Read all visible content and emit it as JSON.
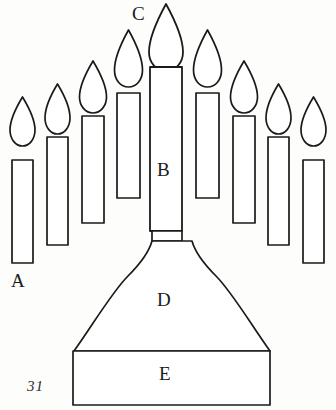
{
  "figure": {
    "number": "31",
    "style": "line-drawing",
    "stroke_color": "#1a1a1a",
    "fill_color": "#ffffff",
    "background_color": "#fdfdfb",
    "width": 336,
    "height": 410
  },
  "labels": {
    "a": "A",
    "b": "B",
    "c": "C",
    "d": "D",
    "e": "E"
  },
  "label_meanings": {
    "a": "outer candle body",
    "b": "central shaft",
    "c": "central flame",
    "d": "flared base",
    "e": "plinth"
  },
  "diagram_data": {
    "type": "line-drawing",
    "candle_count": 9,
    "flame_count": 9,
    "candles": [
      {
        "index": 1,
        "side": "left",
        "body": {
          "x": 12,
          "y": 160,
          "w": 21,
          "h": 103
        },
        "flame": {
          "cx": 22.5,
          "tip_y": 97,
          "base_y": 146,
          "rx": 12
        }
      },
      {
        "index": 2,
        "side": "left",
        "body": {
          "x": 47,
          "y": 137,
          "w": 21,
          "h": 108
        },
        "flame": {
          "cx": 57.5,
          "tip_y": 84,
          "base_y": 128,
          "rx": 12
        }
      },
      {
        "index": 3,
        "side": "left",
        "body": {
          "x": 82,
          "y": 116,
          "w": 22,
          "h": 107
        },
        "flame": {
          "cx": 93,
          "tip_y": 61,
          "base_y": 106,
          "rx": 13
        }
      },
      {
        "index": 4,
        "side": "left",
        "body": {
          "x": 117,
          "y": 93,
          "w": 23,
          "h": 105
        },
        "flame": {
          "cx": 128.5,
          "tip_y": 30,
          "base_y": 80,
          "rx": 13
        }
      },
      {
        "index": 5,
        "side": "center",
        "body": {
          "x": 150,
          "y": 67,
          "w": 32,
          "h": 164
        },
        "flame": {
          "cx": 166,
          "tip_y": 4,
          "base_y": 58,
          "rx": 16
        }
      },
      {
        "index": 6,
        "side": "right",
        "body": {
          "x": 196,
          "y": 93,
          "w": 23,
          "h": 105
        },
        "flame": {
          "cx": 207.5,
          "tip_y": 30,
          "base_y": 80,
          "rx": 13
        }
      },
      {
        "index": 7,
        "side": "right",
        "body": {
          "x": 233,
          "y": 116,
          "w": 22,
          "h": 107
        },
        "flame": {
          "cx": 244,
          "tip_y": 61,
          "base_y": 106,
          "rx": 13
        }
      },
      {
        "index": 8,
        "side": "right",
        "body": {
          "x": 268,
          "y": 137,
          "w": 21,
          "h": 108
        },
        "flame": {
          "cx": 278.5,
          "tip_y": 84,
          "base_y": 128,
          "rx": 12
        }
      },
      {
        "index": 9,
        "side": "right",
        "body": {
          "x": 303,
          "y": 160,
          "w": 21,
          "h": 103
        },
        "flame": {
          "cx": 313.5,
          "tip_y": 97,
          "base_y": 146,
          "rx": 12
        }
      }
    ],
    "base": {
      "neck": {
        "x": 152,
        "y": 231,
        "w": 30,
        "h": 10
      },
      "flare": {
        "top_left_x": 152,
        "top_right_x": 182,
        "top_y": 241,
        "bottom_left_x": 74,
        "bottom_right_x": 270,
        "bottom_y": 351
      },
      "plinth": {
        "x": 73,
        "y": 351,
        "w": 197,
        "h": 54
      }
    }
  }
}
